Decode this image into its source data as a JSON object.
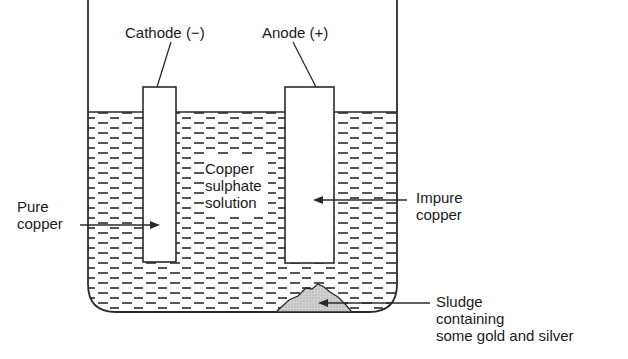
{
  "diagram": {
    "labels": {
      "cathode": "Cathode (−)",
      "anode": "Anode (+)",
      "pure_copper": [
        "Pure",
        "copper"
      ],
      "solution": [
        "Copper",
        "sulphate",
        "solution"
      ],
      "impure_copper": [
        "Impure",
        "copper"
      ],
      "sludge": [
        "Sludge",
        "containing",
        "some gold and silver"
      ]
    },
    "components": {
      "beaker": {
        "left": 88,
        "right": 397,
        "top": 0,
        "bottom": 312,
        "liquid_level": 112,
        "corner_radius": 28
      },
      "cathode_plate": {
        "x": 143,
        "y": 87,
        "width": 33,
        "height": 175
      },
      "anode_plate": {
        "x": 285,
        "y": 87,
        "width": 49,
        "height": 176
      },
      "sludge_pile": {
        "fill": "#c8c8c8"
      }
    },
    "colors": {
      "line": "#2a2a2a",
      "sludge": "#c8c8c8",
      "background": "#ffffff"
    }
  }
}
